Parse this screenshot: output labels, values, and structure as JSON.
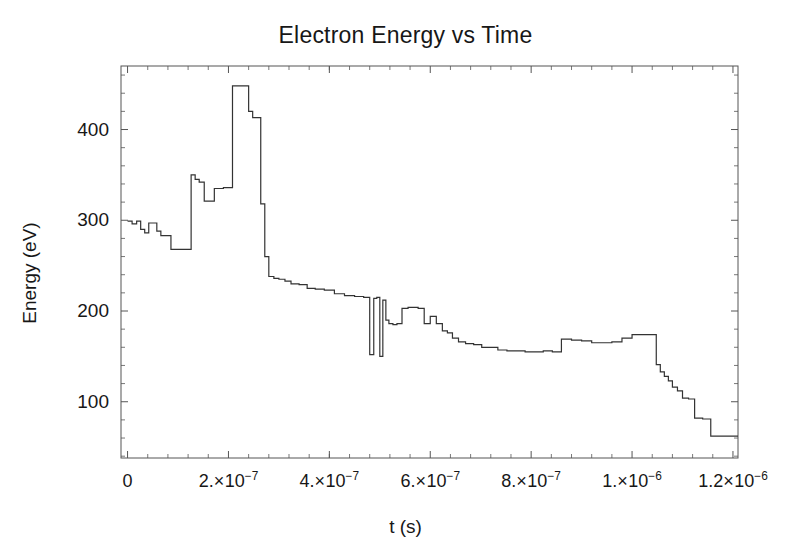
{
  "chart_data": {
    "type": "line",
    "title": "Electron Energy vs Time",
    "xlabel": "t (s)",
    "ylabel": "Energy (eV)",
    "xlim": [
      -1.3e-08,
      1.21e-06
    ],
    "ylim": [
      38,
      470
    ],
    "grid": false,
    "legend": "none",
    "line_style": "step-post",
    "line_color": "#333333",
    "line_width": 1.2,
    "x_tick_values": [
      0,
      2e-07,
      4e-07,
      6e-07,
      8e-07,
      1e-06,
      1.2e-06
    ],
    "x_tick_labels": [
      "0",
      "2.×10⁻⁷",
      "4.×10⁻⁷",
      "6.×10⁻⁷",
      "8.×10⁻⁷",
      "1.×10⁻⁶",
      "1.2×10⁻⁶"
    ],
    "x_tick_parts": [
      {
        "mantissa": "0",
        "times": "",
        "base": "",
        "exp": ""
      },
      {
        "mantissa": "2.",
        "times": "×",
        "base": "10",
        "exp": "-7"
      },
      {
        "mantissa": "4.",
        "times": "×",
        "base": "10",
        "exp": "-7"
      },
      {
        "mantissa": "6.",
        "times": "×",
        "base": "10",
        "exp": "-7"
      },
      {
        "mantissa": "8.",
        "times": "×",
        "base": "10",
        "exp": "-7"
      },
      {
        "mantissa": "1.",
        "times": "×",
        "base": "10",
        "exp": "-6"
      },
      {
        "mantissa": "1.2",
        "times": "×",
        "base": "10",
        "exp": "-6"
      }
    ],
    "y_tick_values": [
      100,
      200,
      300,
      400
    ],
    "y_tick_labels": [
      "100",
      "200",
      "300",
      "400"
    ],
    "y_minor_step": 20,
    "x_minor_step": 4e-08,
    "x_unit": 1e-07,
    "x": [
      0.0,
      0.09,
      0.18,
      0.26,
      0.34,
      0.42,
      0.5,
      0.58,
      0.66,
      0.74,
      0.86,
      0.98,
      1.1,
      1.18,
      1.26,
      1.34,
      1.42,
      1.52,
      1.62,
      1.72,
      1.8,
      1.9,
      2.0,
      2.08,
      2.16,
      2.24,
      2.32,
      2.4,
      2.48,
      2.56,
      2.64,
      2.72,
      2.8,
      2.9,
      3.0,
      3.12,
      3.24,
      3.4,
      3.56,
      3.72,
      3.9,
      4.1,
      4.3,
      4.5,
      4.68,
      4.8,
      4.88,
      4.94,
      5.0,
      5.06,
      5.12,
      5.18,
      5.26,
      5.34,
      5.44,
      5.56,
      5.66,
      5.76,
      5.88,
      6.0,
      6.12,
      6.24,
      6.34,
      6.44,
      6.56,
      6.7,
      6.86,
      7.02,
      7.18,
      7.34,
      7.52,
      7.7,
      7.88,
      8.06,
      8.24,
      8.42,
      8.6,
      8.8,
      9.0,
      9.2,
      9.4,
      9.6,
      9.8,
      10.0,
      10.2,
      10.36,
      10.48,
      10.56,
      10.64,
      10.72,
      10.8,
      10.9,
      11.0,
      11.12,
      11.24,
      11.4,
      11.56,
      11.74,
      11.94,
      12.1
    ],
    "y": [
      299,
      296,
      299,
      290,
      286,
      297,
      297,
      288,
      283,
      283,
      268,
      268,
      268,
      268,
      350,
      345,
      342,
      321,
      321,
      335,
      335,
      336,
      336,
      448,
      448,
      448,
      448,
      420,
      413,
      413,
      318,
      260,
      238,
      236,
      235,
      233,
      230,
      229,
      225,
      224,
      223,
      219,
      217,
      216,
      215,
      152,
      214,
      215,
      150,
      212,
      190,
      186,
      185,
      186,
      203,
      204,
      204,
      203,
      186,
      194,
      186,
      178,
      176,
      170,
      166,
      164,
      163,
      160,
      160,
      157,
      156,
      156,
      155,
      155,
      156,
      155,
      169,
      168,
      167,
      165,
      165,
      166,
      170,
      174,
      174,
      174,
      141,
      133,
      128,
      123,
      116,
      112,
      104,
      103,
      82,
      81,
      62,
      62,
      62,
      62
    ]
  }
}
